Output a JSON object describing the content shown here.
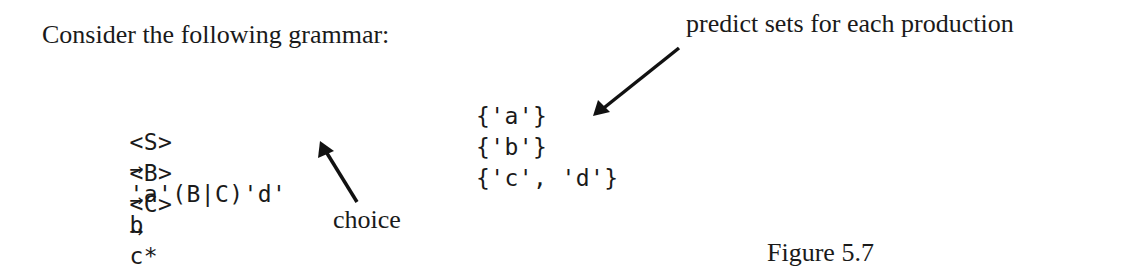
{
  "intro": "Consider the following grammar:",
  "annotations": {
    "predict_label": "predict sets for each production",
    "choice_label": "choice"
  },
  "productions": [
    {
      "lhs": "<S>",
      "arrow": "→",
      "rhs": "'a'(B|C)'d'",
      "predict_set": "{'a'}"
    },
    {
      "lhs": "<B>",
      "arrow": "→",
      "rhs": "b",
      "predict_set": "{'b'}"
    },
    {
      "lhs": "<C>",
      "arrow": "→",
      "rhs": "c*",
      "predict_set": "{'c', 'd'}"
    }
  ],
  "caption": "Figure 5.7"
}
